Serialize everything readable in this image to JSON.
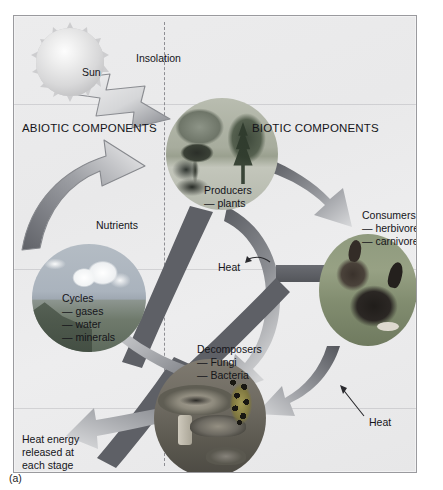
{
  "figure": {
    "caption": "(a)",
    "type": "ecosystem-energy-flow-diagram"
  },
  "regions": {
    "abiotic_label": "ABIOTIC COMPONENTS",
    "biotic_label": "BIOTIC COMPONENTS"
  },
  "nodes": {
    "sun": {
      "label": "Sun",
      "image": "sun-disc"
    },
    "producers": {
      "label": "Producers",
      "sub1": "— plants",
      "image": "forest-trees-photo"
    },
    "consumers": {
      "label": "Consumers",
      "sub1": "— herbivores",
      "sub2": "— carnivores",
      "image": "rabbits-photo"
    },
    "decomposers": {
      "label": "Decomposers",
      "sub1": "— Fungi",
      "sub2": "— Bacteria",
      "image": "mushrooms-frog-photo"
    },
    "cycles": {
      "label": "Cycles",
      "sub1": "— gases",
      "sub2": "— water",
      "sub3": "— minerals",
      "image": "clouds-landscape-photo"
    }
  },
  "flows": {
    "insolation": "Insolation",
    "nutrients": "Nutrients",
    "heat_center": "Heat",
    "heat_right": "Heat",
    "heat_energy_note": "Heat energy\nreleased at\neach stage"
  },
  "colors": {
    "panel_background": "#ececed",
    "frame_border": "#9a9a9e",
    "divider": "#8e8e93",
    "arrow_dark": "#5e6066",
    "arrow_light": "#b9babd",
    "arrow_outline": "#7c7e83",
    "text": "#15151a"
  }
}
